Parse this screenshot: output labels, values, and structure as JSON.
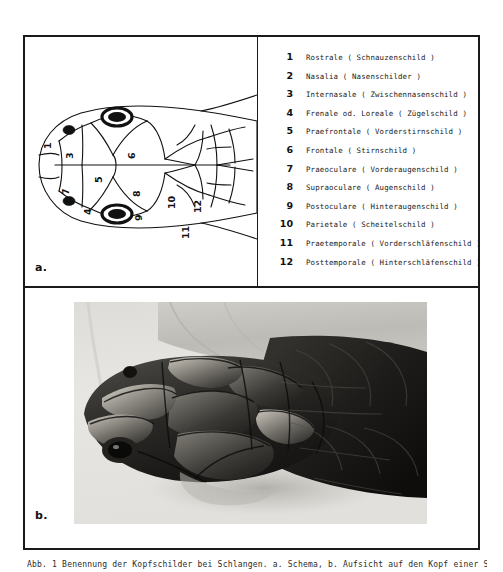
{
  "figure": {
    "panel_a_label": "a.",
    "panel_b_label": "b.",
    "caption": "Abb. 1 Benennung der Kopfschilder bei Schlangen. a. Schema,  b. Aufsicht auf den Kopf einer Schlange"
  },
  "legend": {
    "items": [
      {
        "num": "1",
        "text": "Rostrale ( Schnauzenschild )"
      },
      {
        "num": "2",
        "text": "Nasalia ( Nasenschilder )"
      },
      {
        "num": "3",
        "text": "Internasale ( Zwischennasenschild )"
      },
      {
        "num": "4",
        "text": "Frenale od. Loreale ( Zügelschild )"
      },
      {
        "num": "5",
        "text": "Praefrontale ( Vorderstirnschild )"
      },
      {
        "num": "6",
        "text": "Frontale ( Stirnschild )"
      },
      {
        "num": "7",
        "text": "Praeoculare ( Vorderaugenschild )"
      },
      {
        "num": "8",
        "text": "Supraoculare ( Augenschild )"
      },
      {
        "num": "9",
        "text": "Postoculare ( Hinteraugenschild )"
      },
      {
        "num": "10",
        "text": "Parietale ( Scheitelschild )"
      },
      {
        "num": "11",
        "text": "Praetemporale ( Vorderschläfenschild )"
      },
      {
        "num": "12",
        "text": "Posttemporale ( Hinterschläfenschild )"
      }
    ]
  },
  "diagram": {
    "orientation": "dorsal view, snout at left",
    "callouts": [
      {
        "num": "1",
        "x": 28,
        "y": 108
      },
      {
        "num": "2",
        "x": 26,
        "y": 131
      },
      {
        "num": "3",
        "x": 44,
        "y": 100
      },
      {
        "num": "4",
        "x": 61,
        "y": 140
      },
      {
        "num": "5",
        "x": 72,
        "y": 118
      },
      {
        "num": "6",
        "x": 101,
        "y": 100
      },
      {
        "num": "7",
        "x": 86,
        "y": 146
      },
      {
        "num": "8",
        "x": 107,
        "y": 134
      },
      {
        "num": "9",
        "x": 111,
        "y": 155
      },
      {
        "num": "10",
        "x": 137,
        "y": 140
      },
      {
        "num": "11",
        "x": 150,
        "y": 166
      },
      {
        "num": "12",
        "x": 163,
        "y": 143
      }
    ]
  },
  "photo": {
    "subject": "snake head photograph",
    "description": "black and white dorsal photograph of a snake head on a pale cloth background"
  },
  "colors": {
    "frame": "#1a1a1a",
    "ink": "#111111",
    "paper": "#ffffff"
  }
}
